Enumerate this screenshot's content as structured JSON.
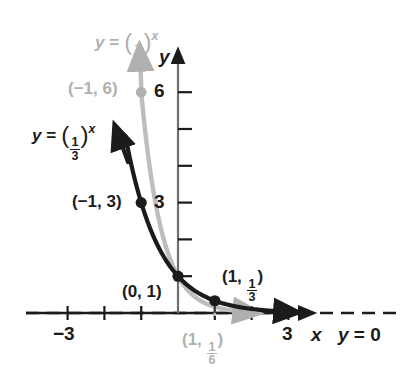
{
  "figure": {
    "kind": "coordinate-graph",
    "background_color": "#ffffff",
    "black_color": "#1b1b1b",
    "gray_color": "#b0b0b0"
  },
  "axes": {
    "x_axis_label": "x",
    "y_axis_label": "y",
    "x_tick_labels": [
      "-3",
      "3"
    ],
    "x_tick_left": "−3",
    "x_tick_right": "3",
    "y_tick_low": "3",
    "y_tick_high": "6",
    "x_range": [
      -3.6,
      3.6
    ],
    "y_range": [
      -0.55,
      6.9
    ],
    "origin_px": [
      178,
      313
    ],
    "unit_px": 36.8,
    "grid": false
  },
  "asymptote": {
    "label": "y = 0",
    "label_y_part": "y",
    "label_eq_part": "= 0",
    "value": 0,
    "style": "dashed"
  },
  "curves": [
    {
      "name": "black-curve",
      "label": "y = (1/3)^x",
      "label_base_num": "1",
      "label_base_den": "3",
      "label_exponent": "x",
      "color": "#1b1b1b",
      "base": 0.3333333333,
      "points": [
        {
          "label": "(-1, 3)",
          "x": -1,
          "y": 3,
          "marker": "filled-dot"
        },
        {
          "label": "(0, 1)",
          "x": 0,
          "y": 1,
          "marker": "filled-dot"
        },
        {
          "label": "(1, 1/3)",
          "x": 1,
          "y": 0.3333333333,
          "marker": "filled-dot"
        }
      ]
    },
    {
      "name": "gray-curve",
      "label": "y = (1/6)^x",
      "label_base_num": "1",
      "label_base_den": "6",
      "label_exponent": "x",
      "color": "#b0b0b0",
      "base": 0.1666666667,
      "points": [
        {
          "label": "(-1, 6)",
          "x": -1,
          "y": 6,
          "marker": "filled-dot"
        },
        {
          "label": "(1, 1/6)",
          "x": 1,
          "y": 0.1666666667,
          "marker": "none"
        }
      ]
    }
  ],
  "point_labels": {
    "neg1_3": "(−1, 3)",
    "zero_1": "(0, 1)",
    "neg1_6": "(−1, 6)",
    "one_third_open": "(1, ",
    "one_third_close": ")",
    "one_sixth_open": "(1, ",
    "one_sixth_close": ")",
    "one": "1",
    "three": "3",
    "six": "6"
  },
  "chart_data": {
    "type": "line",
    "title": "",
    "xlabel": "x",
    "ylabel": "y",
    "xlim": [
      -3.6,
      3.6
    ],
    "ylim": [
      -0.55,
      6.9
    ],
    "grid": false,
    "legend": "inline-curve-labels",
    "xticks": [
      -3,
      -2,
      -1,
      0,
      1,
      2,
      3
    ],
    "xtick_labels": [
      "-3",
      "",
      "",
      "",
      "",
      "",
      "3"
    ],
    "yticks": [
      1,
      2,
      3,
      4,
      5,
      6
    ],
    "ytick_labels": [
      "",
      "",
      "3",
      "",
      "",
      "6"
    ],
    "series": [
      {
        "name": "y = (1/3)^x",
        "color": "#1b1b1b",
        "base": 0.3333333333,
        "x": [
          -1.45,
          -1.25,
          -1,
          -0.75,
          -0.5,
          -0.25,
          0,
          0.5,
          1,
          1.5,
          2,
          2.5,
          3
        ],
        "values": [
          4.78,
          3.86,
          3,
          2.28,
          1.73,
          1.32,
          1,
          0.577,
          0.333,
          0.192,
          0.111,
          0.064,
          0.037
        ],
        "marked_points": [
          [
            -1,
            3
          ],
          [
            0,
            1
          ],
          [
            1,
            0.3333
          ]
        ]
      },
      {
        "name": "y = (1/6)^x",
        "color": "#b0b0b0",
        "base": 0.1666666667,
        "x": [
          -1.1,
          -1,
          -0.75,
          -0.5,
          -0.25,
          0,
          0.5,
          1,
          1.5,
          2,
          2.5,
          3
        ],
        "values": [
          7.8,
          6,
          3.83,
          2.45,
          1.57,
          1,
          0.408,
          0.167,
          0.068,
          0.028,
          0.011,
          0.005
        ],
        "marked_points": [
          [
            -1,
            6
          ],
          [
            1,
            0.1667
          ]
        ]
      }
    ],
    "annotations": [
      {
        "text": "(-1, 6)",
        "x": -1,
        "y": 6,
        "color": "#b0b0b0"
      },
      {
        "text": "(-1, 3)",
        "x": -1,
        "y": 3,
        "color": "#1b1b1b"
      },
      {
        "text": "(0, 1)",
        "x": 0,
        "y": 1,
        "color": "#1b1b1b"
      },
      {
        "text": "(1, 1/3)",
        "x": 1,
        "y": 0.3333,
        "color": "#1b1b1b"
      },
      {
        "text": "(1, 1/6)",
        "x": 1,
        "y": 0.1667,
        "color": "#b0b0b0"
      },
      {
        "text": "y = 0",
        "x": 3.4,
        "y": 0,
        "color": "#1b1b1b"
      }
    ]
  }
}
